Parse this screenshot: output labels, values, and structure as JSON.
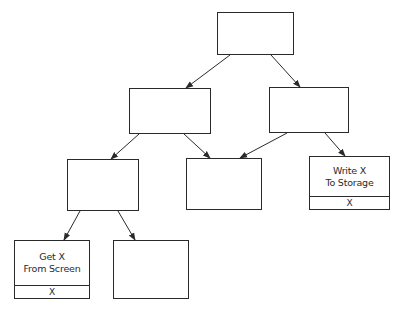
{
  "diagram": {
    "type": "tree",
    "colors": {
      "line": "#2a2a2a",
      "background": "#ffffff"
    },
    "nodes": [
      {
        "id": "n1",
        "line1": "",
        "line2": "",
        "footer": ""
      },
      {
        "id": "n2",
        "line1": "",
        "line2": "",
        "footer": ""
      },
      {
        "id": "n3",
        "line1": "",
        "line2": "",
        "footer": ""
      },
      {
        "id": "n4",
        "line1": "",
        "line2": "",
        "footer": ""
      },
      {
        "id": "n5",
        "line1": "",
        "line2": "",
        "footer": ""
      },
      {
        "id": "n6",
        "line1": "Write X",
        "line2": "To Storage",
        "footer": "X"
      },
      {
        "id": "n7",
        "line1": "Get X",
        "line2": "From Screen",
        "footer": "X"
      },
      {
        "id": "n8",
        "line1": "",
        "line2": "",
        "footer": ""
      }
    ],
    "edges": [
      {
        "from": "n1",
        "to": "n2"
      },
      {
        "from": "n1",
        "to": "n3"
      },
      {
        "from": "n2",
        "to": "n4"
      },
      {
        "from": "n2",
        "to": "n5"
      },
      {
        "from": "n3",
        "to": "n5"
      },
      {
        "from": "n3",
        "to": "n6"
      },
      {
        "from": "n4",
        "to": "n7"
      },
      {
        "from": "n4",
        "to": "n8"
      }
    ]
  }
}
